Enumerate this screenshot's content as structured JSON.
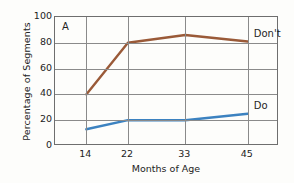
{
  "chart_data": {
    "type": "line",
    "title": "",
    "panel_letter": "A",
    "xlabel": "Months of Age",
    "ylabel": "Percentage of Segments",
    "x": [
      14,
      22,
      33,
      45
    ],
    "xtick_labels": [
      "14",
      "22",
      "33",
      "45"
    ],
    "ytick_labels": [
      "0",
      "20",
      "40",
      "60",
      "80",
      "100"
    ],
    "yticks": [
      0,
      20,
      40,
      60,
      80,
      100
    ],
    "ylim": [
      0,
      100
    ],
    "xlim": [
      8,
      51
    ],
    "grid": "both",
    "legend_position": "right-inline-end-labels",
    "series": [
      {
        "name": "Don't",
        "label": "Don't",
        "color": "#9a5a38",
        "values": [
          40,
          80,
          86,
          81
        ]
      },
      {
        "name": "Do",
        "label": "Do",
        "color": "#3c82c0",
        "values": [
          13,
          20,
          20,
          25
        ]
      }
    ]
  },
  "colors": {
    "background": "#fdfdfb",
    "frame": "#6e6e6e",
    "gridline": "#8a8a8a",
    "text": "#232323",
    "series_dont": "#9a5a38",
    "series_do": "#3c82c0"
  }
}
